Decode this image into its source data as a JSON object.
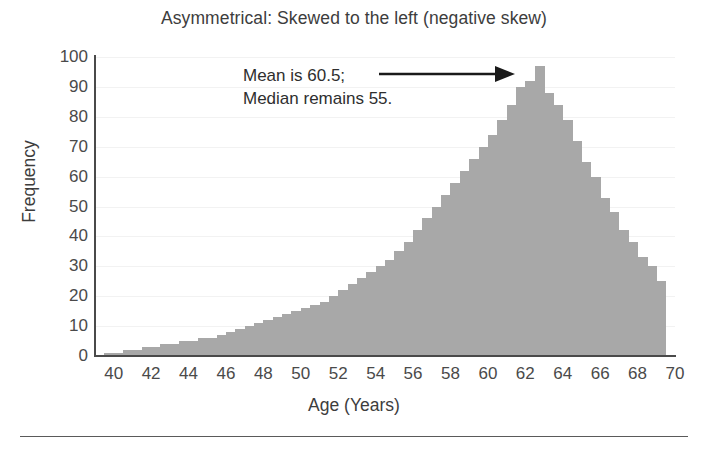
{
  "chart_data": {
    "type": "bar",
    "title": "Asymmetrical: Skewed to the left (negative skew)",
    "xlabel": "Age (Years)",
    "ylabel": "Frequency",
    "xlim": [
      39.5,
      70.5
    ],
    "ylim": [
      0,
      100
    ],
    "grid": true,
    "legend": null,
    "bar_color": "#a8a8a8",
    "bin_width": 0.5,
    "x_ticks": [
      40,
      42,
      44,
      46,
      48,
      50,
      52,
      54,
      56,
      58,
      60,
      62,
      64,
      66,
      68,
      70
    ],
    "y_ticks": [
      0,
      10,
      20,
      30,
      40,
      50,
      60,
      70,
      80,
      90,
      100
    ],
    "x": [
      40.0,
      40.5,
      41.0,
      41.5,
      42.0,
      42.5,
      43.0,
      43.5,
      44.0,
      44.5,
      45.0,
      45.5,
      46.0,
      46.5,
      47.0,
      47.5,
      48.0,
      48.5,
      49.0,
      49.5,
      50.0,
      50.5,
      51.0,
      51.5,
      52.0,
      52.5,
      53.0,
      53.5,
      54.0,
      54.5,
      55.0,
      55.5,
      56.0,
      56.5,
      57.0,
      57.5,
      58.0,
      58.5,
      59.0,
      59.5,
      60.0,
      60.5,
      61.0,
      61.5,
      62.0,
      62.5,
      63.0,
      63.5,
      64.0,
      64.5,
      65.0,
      65.5,
      66.0,
      66.5,
      67.0,
      67.5,
      68.0,
      68.5,
      69.0,
      69.5
    ],
    "values": [
      1,
      1,
      2,
      2,
      3,
      3,
      4,
      4,
      5,
      5,
      6,
      6,
      7,
      8,
      9,
      10,
      11,
      12,
      13,
      14,
      15,
      16,
      17,
      18,
      20,
      22,
      24,
      26,
      28,
      30,
      32,
      35,
      38,
      42,
      46,
      50,
      54,
      58,
      62,
      66,
      70,
      74,
      79,
      84,
      90,
      92,
      97,
      88,
      84,
      79,
      72,
      65,
      60,
      53,
      48,
      42,
      38,
      33,
      30,
      25
    ],
    "annotations": [
      {
        "text_line1": "Mean is 60.5;",
        "text_line2": "Median remains 55.",
        "arrow": "right-arrow",
        "points_to": 63
      }
    ]
  },
  "annotation": {
    "line1": "Mean is 60.5;",
    "line2": "Median remains 55."
  }
}
